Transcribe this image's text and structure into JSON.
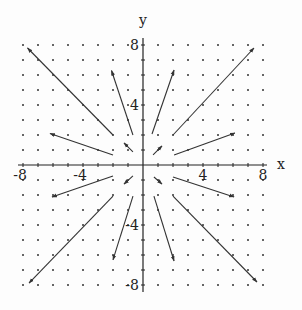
{
  "chart_data": {
    "type": "vector-field",
    "title": "",
    "xlabel": "x",
    "ylabel": "y",
    "xlim": [
      -8,
      8
    ],
    "ylim": [
      -8,
      8
    ],
    "x_ticks": [
      -8,
      -4,
      4,
      8
    ],
    "y_ticks": [
      -8,
      -4,
      4,
      8
    ],
    "x_tick_labels": [
      "-8",
      "-4",
      "4",
      "8"
    ],
    "y_tick_labels": [
      "-8",
      "-4",
      "4",
      "8"
    ],
    "grid_dots": true,
    "grid_step": 1,
    "arrows": [
      {
        "x0": -2.0,
        "y0": 2.0,
        "x1": -7.7,
        "y1": 7.8
      },
      {
        "x0": -0.67,
        "y0": 2.0,
        "x1": -2.1,
        "y1": 6.3
      },
      {
        "x0": -2.0,
        "y0": 0.67,
        "x1": -6.2,
        "y1": 2.1
      },
      {
        "x0": -0.67,
        "y0": 0.87,
        "x1": -1.27,
        "y1": 1.47
      },
      {
        "x0": 2.0,
        "y0": 2.0,
        "x1": 7.4,
        "y1": 7.8
      },
      {
        "x0": 0.6,
        "y0": 2.07,
        "x1": 2.07,
        "y1": 6.33
      },
      {
        "x0": 2.07,
        "y0": 0.67,
        "x1": 6.13,
        "y1": 2.13
      },
      {
        "x0": 0.67,
        "y0": 0.67,
        "x1": 1.27,
        "y1": 1.27
      },
      {
        "x0": 2.0,
        "y0": -0.8,
        "x1": 6.07,
        "y1": -2.13
      },
      {
        "x0": 2.0,
        "y0": -2.07,
        "x1": 7.6,
        "y1": -7.8
      },
      {
        "x0": 0.73,
        "y0": -2.07,
        "x1": 2.07,
        "y1": -6.4
      },
      {
        "x0": 0.73,
        "y0": -0.8,
        "x1": 1.27,
        "y1": -1.27
      },
      {
        "x0": -2.0,
        "y0": -0.73,
        "x1": -6.07,
        "y1": -2.13
      },
      {
        "x0": -2.0,
        "y0": -2.07,
        "x1": -7.6,
        "y1": -7.87
      },
      {
        "x0": -0.67,
        "y0": -2.07,
        "x1": -2.0,
        "y1": -6.33
      },
      {
        "x0": -0.67,
        "y0": -0.73,
        "x1": -1.27,
        "y1": -1.27
      }
    ]
  },
  "colors": {
    "axis": "#222222",
    "arrow": "#333333",
    "dot": "#333333",
    "background": "#fdfdfd"
  }
}
